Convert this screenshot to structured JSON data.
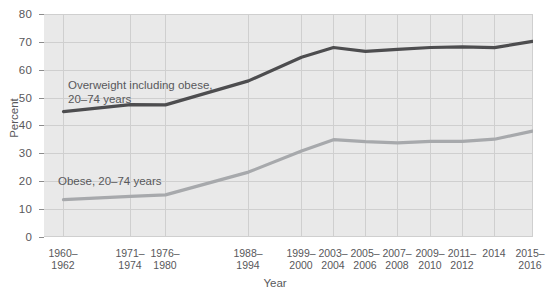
{
  "chart_data": {
    "type": "line",
    "title": "",
    "xlabel": "Year",
    "ylabel": "Percent",
    "ylim": [
      0,
      80
    ],
    "yticks": [
      0,
      10,
      20,
      30,
      40,
      50,
      60,
      70,
      80
    ],
    "grid": true,
    "legend_position": "inline-annotation",
    "categories": [
      "1960–\n1962",
      "1971–\n1974",
      "1976–\n1980",
      "1988–\n1994",
      "1999–\n2000",
      "2003–\n2004",
      "2005–\n2006",
      "2007–\n2008",
      "2009–\n2010",
      "2011–\n2012",
      "2014",
      "2015–\n2016"
    ],
    "series": [
      {
        "name": "Overweight including obese, 20–74 years",
        "color": "#4d4d4f",
        "values": [
          45.0,
          47.5,
          47.4,
          56.0,
          64.5,
          68.0,
          66.6,
          67.3,
          68.0,
          68.2,
          67.9,
          70.2
        ]
      },
      {
        "name": "Obese, 20–74 years",
        "color": "#a7a9ac",
        "values": [
          13.4,
          14.6,
          15.1,
          23.3,
          30.9,
          34.9,
          34.2,
          33.8,
          34.3,
          34.3,
          35.1,
          38.0
        ]
      }
    ],
    "annotations": [
      {
        "text": "Overweight including obese,\n20–74 years",
        "series": "overweight"
      },
      {
        "text": "Obese, 20–74 years",
        "series": "obese"
      }
    ]
  },
  "axis": {
    "y_tick_labels": [
      "80",
      "70",
      "60",
      "50",
      "40",
      "30",
      "20",
      "10",
      "0"
    ],
    "y_axis_title": "Percent",
    "x_axis_title": "Year",
    "x_tick_labels": [
      "1960–\n1962",
      "1971–\n1974",
      "1976–\n1980",
      "1988–\n1994",
      "1999–\n2000",
      "2003–\n2004",
      "2005–\n2006",
      "2007–\n2008",
      "2009–\n2010",
      "2011–\n2012",
      "2014",
      "2015–\n2016"
    ]
  },
  "colors": {
    "plot_background": "#e9e9e9",
    "gridline": "#cfcfcf",
    "overweight_line": "#4d4d4f",
    "obese_line": "#a7a9ac",
    "text": "#58585b"
  }
}
